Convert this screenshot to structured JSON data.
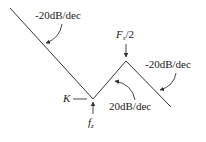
{
  "diagram": {
    "type": "bode-magnitude-asymptote",
    "segments": [
      {
        "label": "-20dB/dec",
        "from": "left edge",
        "to": "f_z"
      },
      {
        "label": "20dB/dec",
        "from": "f_z",
        "to": "F_s/2"
      },
      {
        "label": "-20dB/dec",
        "from": "F_s/2",
        "to": "right"
      }
    ],
    "labels": {
      "slope_left": "-20dB/dec",
      "slope_mid": "20dB/dec",
      "slope_right": "-20dB/dec",
      "peak_main": "F",
      "peak_sub": "s",
      "peak_tail": "/2",
      "valley_main": "f",
      "valley_sub": "z",
      "gain": "K"
    },
    "colors": {
      "line": "#333333",
      "text": "#222222",
      "background": "#ffffff"
    }
  }
}
